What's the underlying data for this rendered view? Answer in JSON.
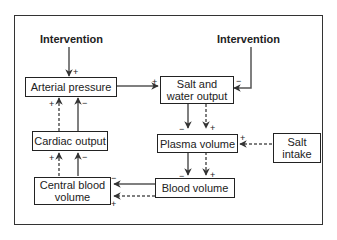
{
  "diagram": {
    "interventions": [
      {
        "id": "intervention-left",
        "label": "Intervention"
      },
      {
        "id": "intervention-right",
        "label": "Intervention"
      }
    ],
    "nodes": {
      "arterial_pressure": "Arterial pressure",
      "salt_water_output_line1": "Salt and",
      "salt_water_output_line2": "water output",
      "cardiac_output": "Cardiac output",
      "plasma_volume": "Plasma volume",
      "salt_intake_line1": "Salt",
      "salt_intake_line2": "intake",
      "central_blood_volume_line1": "Central blood",
      "central_blood_volume_line2": "volume",
      "blood_volume": "Blood volume"
    },
    "signs": {
      "plus": "+",
      "minus": "−"
    },
    "edges": [
      {
        "from": "Intervention (left)",
        "to": "Arterial pressure",
        "sign": "+",
        "style": "solid"
      },
      {
        "from": "Arterial pressure",
        "to": "Salt and water output",
        "sign": "+",
        "style": "solid"
      },
      {
        "from": "Intervention (right)",
        "to": "Salt and water output",
        "sign": "−",
        "style": "solid"
      },
      {
        "from": "Salt and water output",
        "to": "Plasma volume",
        "sign": "−",
        "style": "solid"
      },
      {
        "from": "Salt and water output",
        "to": "Plasma volume",
        "sign": "+",
        "style": "dashed"
      },
      {
        "from": "Salt intake",
        "to": "Plasma volume",
        "sign": "+",
        "style": "dashed"
      },
      {
        "from": "Plasma volume",
        "to": "Blood volume",
        "sign": "−",
        "style": "solid"
      },
      {
        "from": "Plasma volume",
        "to": "Blood volume",
        "sign": "+",
        "style": "dashed"
      },
      {
        "from": "Blood volume",
        "to": "Central blood volume",
        "sign": "−",
        "style": "solid"
      },
      {
        "from": "Blood volume",
        "to": "Central blood volume",
        "sign": "+",
        "style": "dashed"
      },
      {
        "from": "Central blood volume",
        "to": "Cardiac output",
        "sign": "−",
        "style": "solid"
      },
      {
        "from": "Central blood volume",
        "to": "Cardiac output",
        "sign": "+",
        "style": "dashed"
      },
      {
        "from": "Cardiac output",
        "to": "Arterial pressure",
        "sign": "−",
        "style": "solid"
      },
      {
        "from": "Cardiac output",
        "to": "Arterial pressure",
        "sign": "+",
        "style": "dashed"
      }
    ]
  }
}
